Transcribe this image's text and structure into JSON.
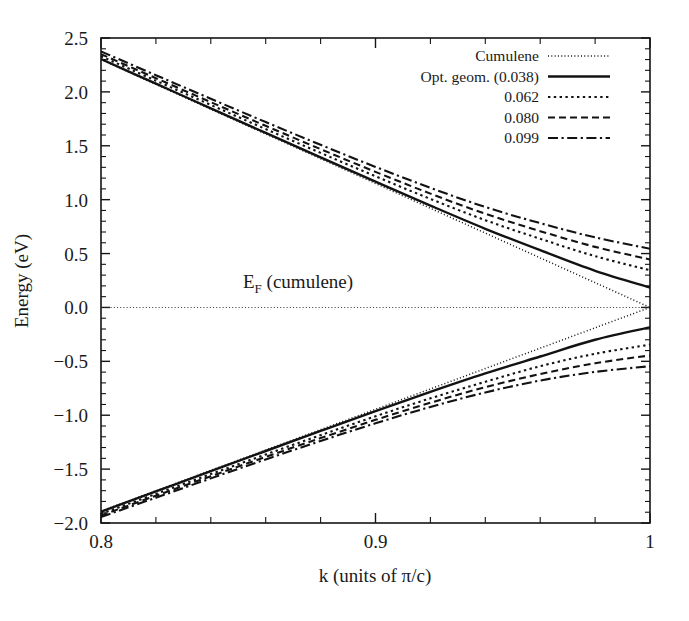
{
  "chart_data": {
    "type": "line",
    "title": "",
    "xlabel": "k (units of π/c)",
    "ylabel": "Energy (eV)",
    "xlim": [
      0.8,
      1.0
    ],
    "ylim": [
      -2.0,
      2.5
    ],
    "grid": false,
    "legend_position": "top-right",
    "xticks": [
      0.8,
      0.9,
      1
    ],
    "xtick_labels": [
      "0.8",
      "0.9",
      "1"
    ],
    "xtick_minor_step": 0.02,
    "yticks": [
      -2.0,
      -1.5,
      -1.0,
      -0.5,
      0.0,
      0.5,
      1.0,
      1.5,
      2.0,
      2.5
    ],
    "ytick_labels": [
      "−2.0",
      "−1.5",
      "−1.0",
      "−0.5",
      "0.0",
      "0.5",
      "1.0",
      "1.5",
      "2.0",
      "2.5"
    ],
    "annotations": [
      {
        "name": "fermi-level-label",
        "text": "E",
        "subscript": "F",
        "suffix": " (cumulene)",
        "x": 0.8875,
        "y": 0.17
      },
      {
        "name": "fermi-level-line",
        "text": "",
        "style": "fine-dotted",
        "y": 0.0
      }
    ],
    "series": [
      {
        "name": "Cumulene",
        "label": "Cumulene",
        "style": "fine-dotted",
        "gap": 0.0,
        "color": "#121212",
        "upper": [
          [
            0.8,
            2.3
          ],
          [
            0.82,
            2.07
          ],
          [
            0.84,
            1.84
          ],
          [
            0.86,
            1.61
          ],
          [
            0.88,
            1.38
          ],
          [
            0.9,
            1.15
          ],
          [
            0.92,
            0.92
          ],
          [
            0.94,
            0.69
          ],
          [
            0.96,
            0.46
          ],
          [
            0.98,
            0.23
          ],
          [
            1.0,
            0.0
          ]
        ],
        "lower": [
          [
            0.8,
            -1.89
          ],
          [
            0.82,
            -1.701
          ],
          [
            0.84,
            -1.512
          ],
          [
            0.86,
            -1.323
          ],
          [
            0.88,
            -1.134
          ],
          [
            0.9,
            -0.945
          ],
          [
            0.92,
            -0.756
          ],
          [
            0.94,
            -0.567
          ],
          [
            0.96,
            -0.378
          ],
          [
            0.98,
            -0.189
          ],
          [
            1.0,
            0.0
          ]
        ]
      },
      {
        "name": "opt-geom-0038",
        "label": "Opt. geom. (0.038)",
        "style": "solid",
        "gap": 0.185,
        "color": "#121212",
        "upper": [
          [
            0.8,
            2.305
          ],
          [
            0.82,
            2.076
          ],
          [
            0.84,
            1.847
          ],
          [
            0.86,
            1.619
          ],
          [
            0.88,
            1.392
          ],
          [
            0.9,
            1.167
          ],
          [
            0.92,
            0.945
          ],
          [
            0.94,
            0.73
          ],
          [
            0.96,
            0.531
          ],
          [
            0.98,
            0.34
          ],
          [
            1.0,
            0.185
          ]
        ],
        "lower": [
          [
            0.8,
            -1.895
          ],
          [
            0.82,
            -1.707
          ],
          [
            0.84,
            -1.519
          ],
          [
            0.86,
            -1.332
          ],
          [
            0.88,
            -1.146
          ],
          [
            0.9,
            -0.962
          ],
          [
            0.92,
            -0.783
          ],
          [
            0.94,
            -0.612
          ],
          [
            0.96,
            -0.455
          ],
          [
            0.98,
            -0.3
          ],
          [
            1.0,
            -0.185
          ]
        ]
      },
      {
        "name": "gap-0062",
        "label": "0.062",
        "style": "dotted",
        "gap": 0.345,
        "color": "#121212",
        "upper": [
          [
            0.8,
            2.33
          ],
          [
            0.82,
            2.104
          ],
          [
            0.84,
            1.879
          ],
          [
            0.86,
            1.655
          ],
          [
            0.88,
            1.434
          ],
          [
            0.9,
            1.217
          ],
          [
            0.92,
            1.007
          ],
          [
            0.94,
            0.81
          ],
          [
            0.96,
            0.637
          ],
          [
            0.98,
            0.476
          ],
          [
            1.0,
            0.345
          ]
        ],
        "lower": [
          [
            0.8,
            -1.915
          ],
          [
            0.82,
            -1.73
          ],
          [
            0.84,
            -1.546
          ],
          [
            0.86,
            -1.364
          ],
          [
            0.88,
            -1.185
          ],
          [
            0.9,
            -1.01
          ],
          [
            0.92,
            -0.843
          ],
          [
            0.94,
            -0.69
          ],
          [
            0.96,
            -0.545
          ],
          [
            0.98,
            -0.43
          ],
          [
            1.0,
            -0.345
          ]
        ]
      },
      {
        "name": "gap-0080",
        "label": "0.080",
        "style": "dashed",
        "gap": 0.445,
        "color": "#121212",
        "upper": [
          [
            0.8,
            2.35
          ],
          [
            0.82,
            2.127
          ],
          [
            0.84,
            1.905
          ],
          [
            0.86,
            1.685
          ],
          [
            0.88,
            1.469
          ],
          [
            0.9,
            1.258
          ],
          [
            0.92,
            1.056
          ],
          [
            0.94,
            0.869
          ],
          [
            0.96,
            0.708
          ],
          [
            0.98,
            0.562
          ],
          [
            1.0,
            0.445
          ]
        ],
        "lower": [
          [
            0.8,
            -1.93
          ],
          [
            0.82,
            -1.747
          ],
          [
            0.84,
            -1.566
          ],
          [
            0.86,
            -1.387
          ],
          [
            0.88,
            -1.212
          ],
          [
            0.9,
            -1.043
          ],
          [
            0.92,
            -0.884
          ],
          [
            0.94,
            -0.74
          ],
          [
            0.96,
            -0.618
          ],
          [
            0.98,
            -0.518
          ],
          [
            1.0,
            -0.445
          ]
        ]
      },
      {
        "name": "gap-0099",
        "label": "0.099",
        "style": "dash-dot",
        "gap": 0.545,
        "color": "#121212",
        "upper": [
          [
            0.8,
            2.375
          ],
          [
            0.82,
            2.155
          ],
          [
            0.84,
            1.936
          ],
          [
            0.86,
            1.72
          ],
          [
            0.88,
            1.509
          ],
          [
            0.9,
            1.304
          ],
          [
            0.92,
            1.11
          ],
          [
            0.94,
            0.932
          ],
          [
            0.96,
            0.782
          ],
          [
            0.98,
            0.65
          ],
          [
            1.0,
            0.545
          ]
        ],
        "lower": [
          [
            0.8,
            -1.945
          ],
          [
            0.82,
            -1.765
          ],
          [
            0.84,
            -1.586
          ],
          [
            0.86,
            -1.41
          ],
          [
            0.88,
            -1.239
          ],
          [
            0.9,
            -1.075
          ],
          [
            0.92,
            -0.923
          ],
          [
            0.94,
            -0.789
          ],
          [
            0.96,
            -0.678
          ],
          [
            0.98,
            -0.598
          ],
          [
            1.0,
            -0.545
          ]
        ]
      }
    ]
  },
  "legend": {
    "entries": [
      {
        "label": "Cumulene",
        "style": "fine-dotted"
      },
      {
        "label": "Opt. geom. (0.038)",
        "style": "solid"
      },
      {
        "label": "0.062",
        "style": "dotted"
      },
      {
        "label": "0.080",
        "style": "dashed"
      },
      {
        "label": "0.099",
        "style": "dash-dot"
      }
    ]
  },
  "axes": {
    "x_title": "k (units of π/c)",
    "y_title": "Energy (eV)"
  },
  "fermi": {
    "symbol": "E",
    "subscript": "F",
    "text": " (cumulene)"
  }
}
